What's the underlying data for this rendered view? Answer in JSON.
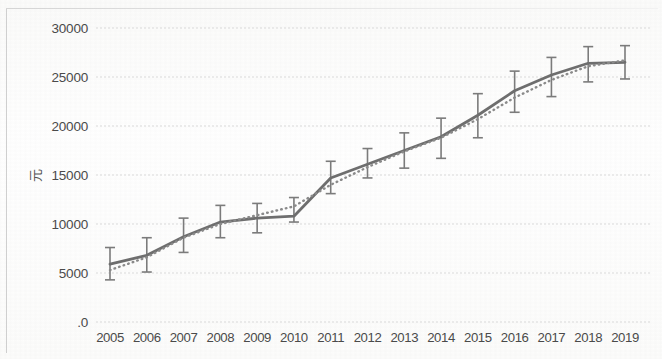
{
  "chart_data": {
    "type": "line",
    "title": "",
    "subtitle": "",
    "xlabel": "",
    "ylabel": "元",
    "categories": [
      "2005",
      "2006",
      "2007",
      "2008",
      "2009",
      "2010",
      "2011",
      "2012",
      "2013",
      "2014",
      "2015",
      "2016",
      "2017",
      "2018",
      "2019"
    ],
    "ylim": [
      0,
      30000
    ],
    "ytick_labels": [
      "30000",
      "25000",
      "20000",
      "15000",
      "10000",
      "5000",
      ".0"
    ],
    "ytick_values": [
      30000,
      25000,
      20000,
      15000,
      10000,
      5000,
      0
    ],
    "grid": "horizontal",
    "legend": "none",
    "series": [
      {
        "name": "mean",
        "style": "solid",
        "color": "#6e6e6e",
        "values": [
          5900,
          6800,
          8700,
          10200,
          10600,
          10800,
          14700,
          16100,
          17500,
          18900,
          21100,
          23600,
          25200,
          26400,
          26500
        ],
        "error_low": [
          4300,
          5100,
          7100,
          8600,
          9100,
          10200,
          13100,
          14700,
          15700,
          16700,
          18800,
          21400,
          23000,
          24500,
          24800
        ],
        "error_high": [
          7600,
          8600,
          10600,
          11900,
          12100,
          12700,
          16400,
          17700,
          19300,
          20800,
          23300,
          25600,
          27000,
          28100,
          28200
        ]
      },
      {
        "name": "trend",
        "style": "dotted",
        "color": "#8a8a8a",
        "values": [
          5300,
          6600,
          8600,
          10000,
          10900,
          11800,
          14000,
          15800,
          17400,
          18800,
          20700,
          22900,
          24700,
          26100,
          26700
        ]
      }
    ]
  },
  "axes": {
    "y_title": "元"
  }
}
